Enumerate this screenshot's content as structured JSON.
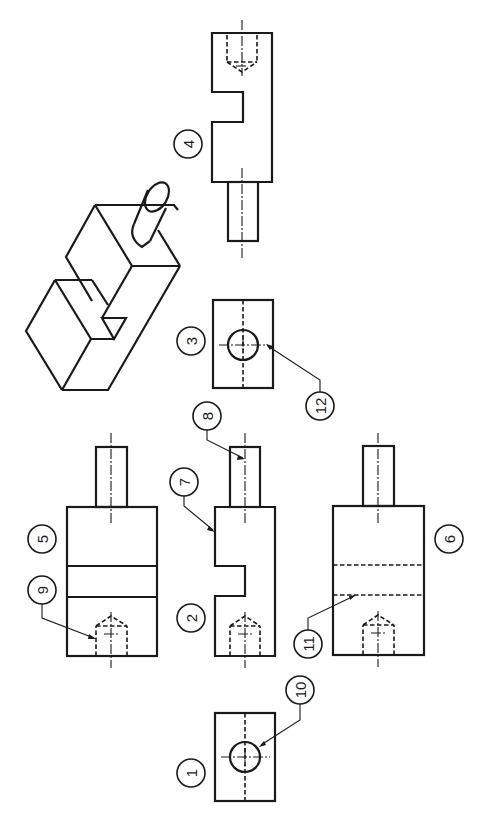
{
  "drawing": {
    "title": "Orthographic projection exercise - identify views and features",
    "orientation": "rotated 90 degrees (labels read bottom-to-top)",
    "colors": {
      "line": "#1a1a1a",
      "background": "#ffffff"
    }
  },
  "balloons": [
    {
      "id": "1",
      "label": "1",
      "cx": 191,
      "cy": 773
    },
    {
      "id": "2",
      "label": "2",
      "cx": 191,
      "cy": 618
    },
    {
      "id": "3",
      "label": "3",
      "cx": 191,
      "cy": 341
    },
    {
      "id": "4",
      "label": "4",
      "cx": 188,
      "cy": 144
    },
    {
      "id": "5",
      "label": "5",
      "cx": 42,
      "cy": 539
    },
    {
      "id": "6",
      "label": "6",
      "cx": 449,
      "cy": 539
    },
    {
      "id": "7",
      "label": "7",
      "cx": 184,
      "cy": 482
    },
    {
      "id": "8",
      "label": "8",
      "cx": 207,
      "cy": 416
    },
    {
      "id": "9",
      "label": "9",
      "cx": 42,
      "cy": 590
    },
    {
      "id": "10",
      "label": "10",
      "cx": 300,
      "cy": 690
    },
    {
      "id": "11",
      "label": "11",
      "cx": 308,
      "cy": 644
    },
    {
      "id": "12",
      "label": "12",
      "cx": 320,
      "cy": 406
    }
  ],
  "views": {
    "view_1": {
      "name": "end-view-circle",
      "rect": [
        215,
        713,
        60,
        88
      ]
    },
    "view_2": {
      "name": "front-view-slotted",
      "rect": [
        215,
        506,
        60,
        149
      ]
    },
    "view_3": {
      "name": "end-view-circle-hidden-axis",
      "rect": [
        213,
        300,
        60,
        88
      ]
    },
    "view_4": {
      "name": "side-view-slotted-top",
      "rect": [
        212,
        33,
        60,
        149
      ]
    },
    "view_5": {
      "name": "top-view-solid-bands",
      "rect": [
        67,
        507,
        90,
        149
      ]
    },
    "view_6": {
      "name": "bottom-view-hidden-bands",
      "rect": [
        333,
        506,
        91,
        149
      ]
    },
    "isometric": {
      "name": "isometric-pictorial"
    }
  },
  "features": {
    "7": "shoulder edge",
    "8": "shaft center line",
    "9": "tapped hole (hidden)",
    "10": "through hole circle",
    "11": "hidden slot edge",
    "12": "hole circle (end view)"
  }
}
